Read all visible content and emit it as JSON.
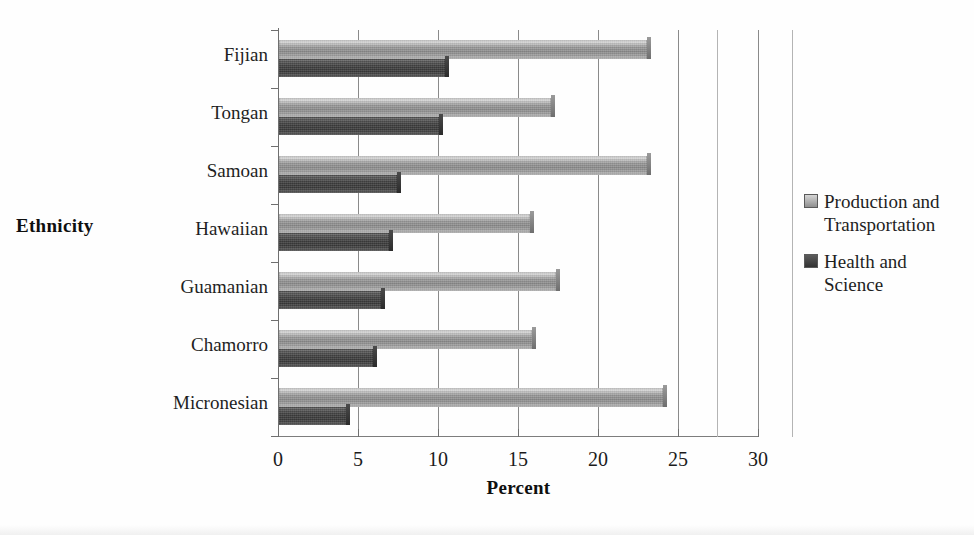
{
  "chart_data": {
    "type": "bar",
    "orientation": "horizontal",
    "title": "",
    "xlabel": "Percent",
    "ylabel": "Ethnicity",
    "categories": [
      "Micronesian",
      "Chamorro",
      "Guamanian",
      "Hawaiian",
      "Samoan",
      "Tongan",
      "Fijian"
    ],
    "series": [
      {
        "name": "Production and Transportation",
        "color": "#9a9a9a",
        "values": [
          24.0,
          15.8,
          17.3,
          15.7,
          23.0,
          17.0,
          23.0
        ]
      },
      {
        "name": "Health and Science",
        "color": "#3d3d3d",
        "values": [
          4.2,
          5.9,
          6.4,
          6.9,
          7.4,
          10.0,
          10.4
        ]
      }
    ],
    "xlim": [
      0,
      30
    ],
    "xticks": [
      0,
      5,
      10,
      15,
      20,
      25,
      30
    ],
    "xtick_labels": [
      "0",
      "5",
      "10",
      "15",
      "20",
      "25",
      "30"
    ],
    "grid": "vertical",
    "legend_position": "right"
  },
  "axis": {
    "x_title": "Percent",
    "y_title": "Ethnicity"
  },
  "legend": {
    "items": [
      {
        "label_line1": "Production and",
        "label_line2": "Transportation",
        "swatch": "light-gray-swatch"
      },
      {
        "label_line1": "Health and",
        "label_line2": "Science",
        "swatch": "dark-gray-swatch"
      }
    ]
  }
}
